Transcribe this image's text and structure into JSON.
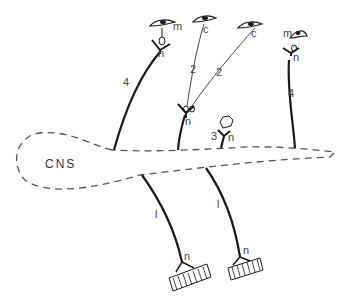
{
  "diagram": {
    "region_label": "CNS",
    "labels": {
      "m": "m",
      "c": "c",
      "n": "n",
      "l": "l",
      "one": "1",
      "two": "2",
      "three": "3",
      "four": "4"
    },
    "pathways": [
      {
        "id": "left-4",
        "type": "4",
        "ending": "m",
        "junction": "n"
      },
      {
        "id": "center-2",
        "type": "2",
        "endings": [
          "c",
          "c"
        ],
        "junction": "n"
      },
      {
        "id": "small-3",
        "type": "3",
        "junction": "n"
      },
      {
        "id": "right-4",
        "type": "4",
        "ending": "m",
        "junction": "n"
      },
      {
        "id": "motor-left",
        "type": "l",
        "junction": "n",
        "target": "muscle"
      },
      {
        "id": "motor-right",
        "type": "l",
        "junction": "n",
        "target": "muscle"
      }
    ],
    "colors": {
      "line": "#1a1a1a",
      "dashed": "#555555",
      "background": "#ffffff"
    }
  }
}
